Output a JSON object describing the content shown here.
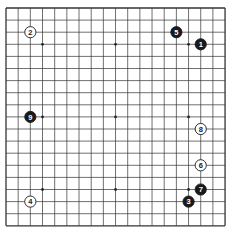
{
  "diagram": {
    "type": "go-board",
    "size": 19,
    "origin": {
      "x": 6,
      "y": 8
    },
    "spacing": {
      "x": 12.17,
      "y": 12.1
    },
    "line_color": "#333333",
    "background": "#ffffff",
    "star_points": [
      [
        4,
        4
      ],
      [
        4,
        10
      ],
      [
        4,
        16
      ],
      [
        10,
        4
      ],
      [
        10,
        10
      ],
      [
        10,
        16
      ],
      [
        16,
        4
      ],
      [
        16,
        10
      ],
      [
        16,
        16
      ]
    ],
    "stones": [
      {
        "move": "1",
        "color": "black",
        "col": 17,
        "row": 4
      },
      {
        "move": "2",
        "color": "white",
        "col": 3,
        "row": 3
      },
      {
        "move": "3",
        "color": "black",
        "col": 16,
        "row": 17
      },
      {
        "move": "4",
        "color": "white",
        "col": 3,
        "row": 17
      },
      {
        "move": "5",
        "color": "black",
        "col": 15,
        "row": 3
      },
      {
        "move": "6",
        "color": "white",
        "col": 17,
        "row": 14
      },
      {
        "move": "7",
        "color": "black",
        "col": 17,
        "row": 16
      },
      {
        "move": "8",
        "color": "white",
        "col": 17,
        "row": 11
      },
      {
        "move": "9",
        "color": "black",
        "col": 3,
        "row": 10
      }
    ]
  }
}
